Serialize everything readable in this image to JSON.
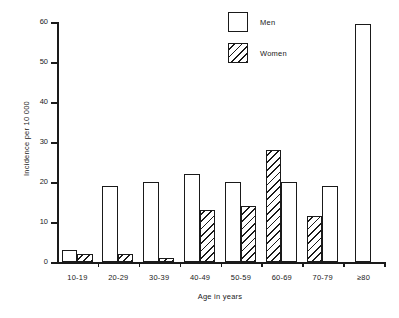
{
  "chart_data": {
    "type": "bar",
    "title": "",
    "xlabel": "Age in years",
    "ylabel": "Incidence per 10 000",
    "categories": [
      "10-19",
      "20-29",
      "30-39",
      "40-49",
      "50-59",
      "60-69",
      "70-79",
      "≥80"
    ],
    "series": [
      {
        "name": "Men",
        "values": [
          3,
          19,
          20,
          22,
          20,
          20,
          19,
          59.5
        ]
      },
      {
        "name": "Women",
        "values": [
          2,
          2,
          1,
          13,
          14,
          28,
          11.5,
          0
        ]
      }
    ],
    "ylim": [
      0,
      60
    ],
    "yticks": [
      0,
      10,
      20,
      30,
      40,
      50,
      60
    ],
    "ytick_labels": [
      "0",
      "10",
      "20",
      "30",
      "40",
      "50",
      "60"
    ],
    "grid": false,
    "legend_position": "top-right",
    "legend": [
      {
        "label": "Men",
        "pattern": "solid-outline"
      },
      {
        "label": "Women",
        "pattern": "diagonal-hatch"
      }
    ],
    "group_order": [
      {
        "category": "10-19",
        "bars": [
          {
            "series": "Men",
            "value": 3
          },
          {
            "series": "Women",
            "value": 2
          }
        ]
      },
      {
        "category": "20-29",
        "bars": [
          {
            "series": "Men",
            "value": 19
          },
          {
            "series": "Women",
            "value": 2
          }
        ]
      },
      {
        "category": "30-39",
        "bars": [
          {
            "series": "Men",
            "value": 20
          },
          {
            "series": "Women",
            "value": 1
          }
        ]
      },
      {
        "category": "40-49",
        "bars": [
          {
            "series": "Men",
            "value": 22
          },
          {
            "series": "Women",
            "value": 13
          }
        ]
      },
      {
        "category": "50-59",
        "bars": [
          {
            "series": "Men",
            "value": 20
          },
          {
            "series": "Women",
            "value": 14
          }
        ]
      },
      {
        "category": "60-69",
        "bars": [
          {
            "series": "Women",
            "value": 28
          },
          {
            "series": "Men",
            "value": 20
          }
        ]
      },
      {
        "category": "70-79",
        "bars": [
          {
            "series": "Women",
            "value": 11.5
          },
          {
            "series": "Men",
            "value": 19
          }
        ]
      },
      {
        "category": "≥80",
        "bars": [
          {
            "series": "Men",
            "value": 59.5
          }
        ]
      }
    ]
  }
}
